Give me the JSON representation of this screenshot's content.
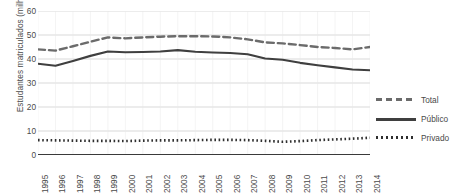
{
  "chart_data": {
    "type": "line",
    "title": "",
    "xlabel": "",
    "ylabel": "Estudantes matriculados (milhões)",
    "ylim": [
      0,
      60
    ],
    "yticks": [
      0,
      10,
      20,
      30,
      40,
      50,
      60
    ],
    "ytick_labels": [
      "0",
      "10",
      "20",
      "30",
      "40",
      "50",
      "60"
    ],
    "grid": true,
    "grid_axis": "y",
    "legend_position": "right",
    "categories": [
      "1995",
      "1996",
      "1997",
      "1998",
      "1999",
      "2000",
      "2001",
      "2002",
      "2003",
      "2004",
      "2005",
      "2006",
      "2007",
      "2008",
      "2009",
      "2010",
      "2011",
      "2012",
      "2013",
      "2014"
    ],
    "series": [
      {
        "name": "Total",
        "style": "dashed",
        "color": "#6b6b6b",
        "values": [
          44.0,
          43.5,
          45.3,
          47.2,
          49.0,
          48.6,
          49.0,
          49.3,
          49.5,
          49.5,
          49.4,
          49.0,
          48.2,
          46.9,
          46.5,
          45.8,
          45.0,
          44.6,
          44.0,
          45.0
        ]
      },
      {
        "name": "Público",
        "style": "solid",
        "color": "#3f3f3f",
        "values": [
          38.0,
          37.2,
          39.2,
          41.3,
          43.1,
          42.8,
          42.9,
          43.1,
          43.7,
          43.0,
          42.7,
          42.5,
          42.0,
          40.2,
          39.7,
          38.4,
          37.4,
          36.5,
          35.6,
          35.3
        ]
      },
      {
        "name": "Privado",
        "style": "dotted",
        "color": "#2f2f2f",
        "values": [
          6.2,
          6.1,
          6.0,
          5.9,
          5.9,
          5.8,
          6.0,
          6.1,
          6.1,
          6.2,
          6.3,
          6.3,
          6.2,
          5.9,
          5.5,
          5.8,
          6.2,
          6.5,
          6.8,
          7.2
        ]
      }
    ]
  },
  "legend": {
    "items": [
      {
        "label": "Total"
      },
      {
        "label": "Público"
      },
      {
        "label": "Privado"
      }
    ]
  },
  "axes": {
    "y_title": "Estudantes matriculados (milhões)"
  },
  "colors": {
    "grid": "#c9c9c9",
    "axis": "#3a3a3a",
    "total": "#6b6b6b",
    "publico": "#3f3f3f",
    "privado": "#2f2f2f"
  }
}
